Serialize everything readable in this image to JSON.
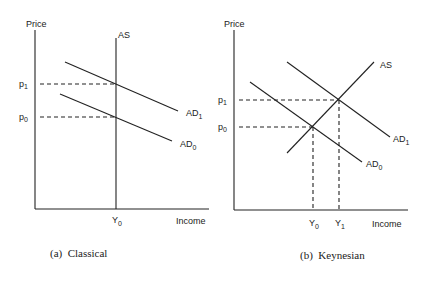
{
  "panels": [
    {
      "id": "classical",
      "caption": "(a)  Classical",
      "y_axis_label": "Price",
      "x_axis_label": "Income",
      "curves": {
        "as": "AS",
        "ad1_base": "AD",
        "ad1_sub": "1",
        "ad0_base": "AD",
        "ad0_sub": "0"
      },
      "price_ticks": {
        "p1_base": "p",
        "p1_sub": "1",
        "p0_base": "p",
        "p0_sub": "0"
      },
      "income_ticks": {
        "y0_base": "Y",
        "y0_sub": "0"
      }
    },
    {
      "id": "keynesian",
      "caption": "(b)  Keynesian",
      "y_axis_label": "Price",
      "x_axis_label": "Income",
      "curves": {
        "as": "AS",
        "ad1_base": "AD",
        "ad1_sub": "1",
        "ad0_base": "AD",
        "ad0_sub": "0"
      },
      "price_ticks": {
        "p1_base": "p",
        "p1_sub": "1",
        "p0_base": "p",
        "p0_sub": "0"
      },
      "income_ticks": {
        "y0_base": "Y",
        "y0_sub": "0",
        "y1_base": "Y",
        "y1_sub": "1"
      }
    }
  ],
  "colors": {
    "line": "#222222",
    "background": "#ffffff"
  }
}
